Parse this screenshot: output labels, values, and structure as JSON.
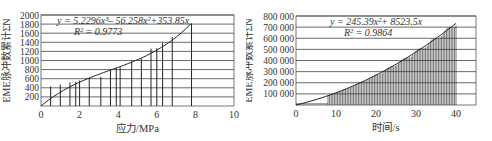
{
  "chart_data": [
    {
      "type": "bar",
      "title": "",
      "xlabel": "应力/MPa",
      "ylabel": "EME脉冲数累计ΣN",
      "xlim": [
        0,
        10
      ],
      "ylim": [
        0,
        2000
      ],
      "xticks": [
        0,
        2,
        4,
        6,
        8,
        10
      ],
      "yticks": [
        200,
        400,
        600,
        800,
        1000,
        1200,
        1400,
        1600,
        1800,
        2000
      ],
      "grid": "horizontal",
      "bars": {
        "x": [
          0.5,
          1.0,
          1.5,
          1.8,
          2.0,
          2.5,
          3.1,
          3.6,
          3.9,
          4.1,
          4.7,
          5.2,
          5.7,
          6.0,
          6.3,
          6.8,
          7.8
        ],
        "y": [
          430,
          470,
          520,
          530,
          560,
          620,
          640,
          790,
          830,
          850,
          980,
          1040,
          1260,
          1270,
          1390,
          1520,
          1800
        ]
      },
      "fit": {
        "equation": "y = 5.2296x³− 56.258x²+353.85x",
        "r2_label": "R² = 0.9773",
        "coefficients": [
          5.2296,
          -56.258,
          353.85,
          0
        ],
        "x_range": [
          0,
          7.8
        ]
      }
    },
    {
      "type": "bar",
      "title": "",
      "xlabel": "时间/s",
      "ylabel": "EME脉冲数累计ΣN",
      "xlim": [
        0,
        45
      ],
      "ylim": [
        0,
        800000
      ],
      "xticks": [
        0,
        10,
        20,
        30,
        40
      ],
      "yticks": [
        100000,
        200000,
        300000,
        400000,
        500000,
        600000,
        700000,
        800000
      ],
      "ytick_labels": [
        "100 000",
        "200 000",
        "300 000",
        "400 000",
        "500 000",
        "600 000",
        "700 000",
        "800 000"
      ],
      "grid": "horizontal",
      "bars": {
        "x_start": 8,
        "x_end": 40,
        "step": 0.4,
        "note": "dense bars following the fitted curve, small baseline ~10 000 before 8 s"
      },
      "fit": {
        "equation": "y = 245.39x²+ 8523.5x",
        "r2_label": "R² = 0.9864",
        "coefficients": [
          245.39,
          8523.5,
          0
        ],
        "x_range": [
          0,
          40
        ]
      }
    }
  ],
  "labels": {
    "c1": {
      "ylabel": "EME脉冲数累计ΣN",
      "xlabel": "应力/MPa",
      "eq": "y = 5.2296x³– 56.258x²+353.85x",
      "r2": "R² = 0.9773"
    },
    "c2": {
      "ylabel": "EME脉冲数累计ΣN",
      "xlabel": "时间/s",
      "eq": "y = 245.39x²+ 8523.5x",
      "r2": "R² = 0.9864"
    }
  }
}
